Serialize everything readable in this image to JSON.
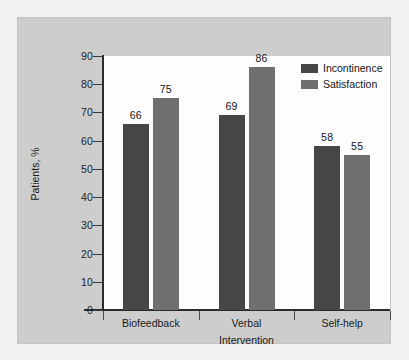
{
  "chart_data": {
    "type": "bar",
    "title": "",
    "xlabel": "Intervention",
    "ylabel": "Patients, %",
    "categories": [
      "Biofeedback",
      "Verbal",
      "Self-help"
    ],
    "series": [
      {
        "name": "Incontinence",
        "color": "#464646",
        "values": [
          66,
          69,
          58
        ]
      },
      {
        "name": "Satisfaction",
        "color": "#6f6f6f",
        "values": [
          75,
          86,
          55
        ]
      }
    ],
    "ylim": [
      0,
      90
    ],
    "ytick_step": 10,
    "yticks": [
      0,
      10,
      20,
      30,
      40,
      50,
      60,
      70,
      80,
      90
    ],
    "ytick_labels": [
      "0",
      "10",
      "20",
      "30",
      "40",
      "50",
      "60",
      "70",
      "80",
      "90"
    ],
    "grid": false,
    "legend_position": "top-right",
    "data_labels": true
  },
  "figure": {
    "panel_color": "#cdcdcd",
    "plot_background": "#fdfdfd",
    "axis_color": "#2b2b2b"
  }
}
